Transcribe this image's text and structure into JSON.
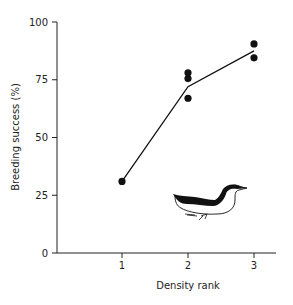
{
  "chart_data": {
    "type": "line",
    "title": "",
    "xlabel": "Density rank",
    "ylabel": "Breeding success (%)",
    "xlim": [
      0.6,
      3.3
    ],
    "ylim": [
      0,
      100
    ],
    "x_ticks": [
      1,
      2,
      3
    ],
    "y_ticks": [
      0,
      25,
      50,
      75,
      100
    ],
    "grid": false,
    "legend": null,
    "series": [
      {
        "name": "observations",
        "kind": "scatter",
        "points": [
          {
            "x": 1,
            "y": 31
          },
          {
            "x": 2,
            "y": 78
          },
          {
            "x": 2,
            "y": 75.5
          },
          {
            "x": 2,
            "y": 67
          },
          {
            "x": 3,
            "y": 90.5
          },
          {
            "x": 3,
            "y": 84.5
          }
        ]
      },
      {
        "name": "mean",
        "kind": "line",
        "points": [
          {
            "x": 1,
            "y": 31
          },
          {
            "x": 2,
            "y": 72
          },
          {
            "x": 3,
            "y": 87.5
          }
        ]
      }
    ],
    "annotations": [
      {
        "type": "illustration",
        "subject": "guillemot-bird",
        "position": "lower-right inside plot"
      }
    ]
  },
  "axes": {
    "x_label": "Density rank",
    "y_label": "Breeding success (%)",
    "x_tick_labels": [
      "1",
      "2",
      "3"
    ],
    "y_tick_labels": [
      "0",
      "25",
      "50",
      "75",
      "100"
    ]
  },
  "colors": {
    "axis": "#222222",
    "marker": "#111111",
    "line": "#111111",
    "background": "#ffffff"
  }
}
